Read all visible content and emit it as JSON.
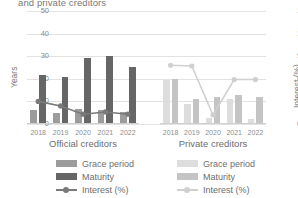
{
  "title": "and private creditors",
  "axes": {
    "left_label": "Years",
    "right_label": "Interest (%)",
    "left_ticks": [
      "0",
      "10",
      "20",
      "30",
      "40",
      "50"
    ],
    "right_ticks": [
      "0",
      "3",
      "6",
      "9",
      "12",
      "15"
    ]
  },
  "panels": {
    "official": {
      "caption": "Official creditors"
    },
    "private": {
      "caption": "Private creditors"
    }
  },
  "legend": {
    "official": {
      "grace": "Grace period",
      "maturity": "Maturity",
      "interest": "Interest (%)"
    },
    "private": {
      "grace": "Grace period",
      "maturity": "Maturity",
      "interest": "Interest (%)"
    }
  },
  "colors": {
    "grace_official": "#9c9c9c",
    "maturity_official": "#666666",
    "interest_official": "#7a7a7a",
    "grace_private": "#dddddd",
    "maturity_private": "#c4c4c4",
    "interest_private": "#d0d0d0",
    "grid": "#e2e2e2",
    "text": "#6e6e6e"
  },
  "chart_data": {
    "type": "bar",
    "title": "and private creditors",
    "xlabel": "",
    "ylabel": "Years",
    "ylabel_secondary": "Interest (%)",
    "ylim": [
      0,
      50
    ],
    "ylim_secondary": [
      0,
      15
    ],
    "grid": true,
    "legend_position": "bottom",
    "categories": [
      "2018",
      "2019",
      "2020",
      "2021",
      "2022"
    ],
    "panels": [
      {
        "name": "Official creditors",
        "series": [
          {
            "name": "Grace period",
            "type": "bar",
            "axis": "left",
            "values": [
              6.2,
              4.8,
              6.8,
              6.4,
              5.3
            ]
          },
          {
            "name": "Maturity",
            "type": "bar",
            "axis": "left",
            "values": [
              21.5,
              20.8,
              29.0,
              30.0,
              25.3
            ]
          },
          {
            "name": "Interest (%)",
            "type": "line",
            "axis": "right",
            "values": [
              3.0,
              2.4,
              1.3,
              1.6,
              1.3
            ]
          }
        ]
      },
      {
        "name": "Private creditors",
        "series": [
          {
            "name": "Grace period",
            "type": "bar",
            "axis": "left",
            "values": [
              19.6,
              8.9,
              2.7,
              10.9,
              2.0
            ]
          },
          {
            "name": "Maturity",
            "type": "bar",
            "axis": "left",
            "values": [
              20.0,
              11.0,
              12.0,
              13.0,
              12.0
            ]
          },
          {
            "name": "Interest (%)",
            "type": "line",
            "axis": "right",
            "values": [
              7.8,
              7.7,
              1.2,
              5.9,
              5.9
            ]
          }
        ]
      }
    ]
  }
}
